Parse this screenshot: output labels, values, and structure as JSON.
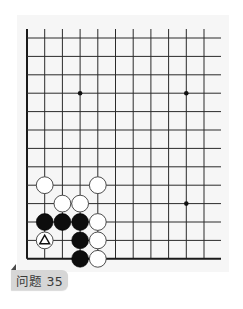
{
  "problem": {
    "label": "问题 35"
  },
  "board": {
    "columns": 11,
    "rows": 13,
    "origin_x": 27,
    "origin_y": 38,
    "col_spacing": 17.7,
    "row_spacing": 18.4,
    "line_top": 29,
    "line_right": 221,
    "stone_radius": 8.4,
    "line_color": "#2b2b2b",
    "border_color": "#1a1a1a",
    "star_points": [
      {
        "col": 3,
        "row": 3
      },
      {
        "col": 9,
        "row": 3
      },
      {
        "col": 9,
        "row": 9
      }
    ],
    "stones": [
      {
        "color": "white",
        "col": 1,
        "row": 8
      },
      {
        "color": "white",
        "col": 4,
        "row": 8
      },
      {
        "color": "white",
        "col": 2,
        "row": 9
      },
      {
        "color": "white",
        "col": 3,
        "row": 9
      },
      {
        "color": "black",
        "col": 1,
        "row": 10
      },
      {
        "color": "black",
        "col": 2,
        "row": 10
      },
      {
        "color": "black",
        "col": 3,
        "row": 10
      },
      {
        "color": "white",
        "col": 4,
        "row": 10
      },
      {
        "color": "white",
        "col": 1,
        "row": 11,
        "mark": "triangle"
      },
      {
        "color": "black",
        "col": 3,
        "row": 11
      },
      {
        "color": "white",
        "col": 4,
        "row": 11
      },
      {
        "color": "black",
        "col": 3,
        "row": 12
      },
      {
        "color": "white",
        "col": 4,
        "row": 12
      }
    ]
  }
}
